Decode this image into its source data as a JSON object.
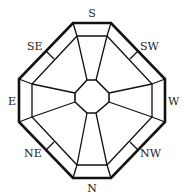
{
  "diagram": {
    "labels": {
      "top": "S",
      "top_right": "SW",
      "right": "W",
      "bottom_right": "NW",
      "bottom": "N",
      "bottom_left": "NE",
      "left": "E",
      "top_left": "SE"
    },
    "colors": {
      "stroke": "#111111",
      "text": "#222222",
      "background": "#ffffff"
    }
  }
}
